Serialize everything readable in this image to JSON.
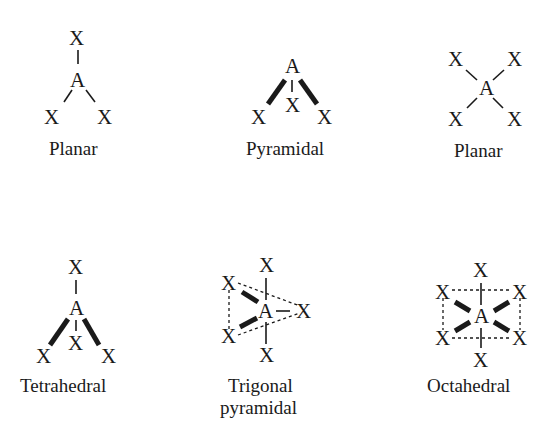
{
  "diagram": {
    "geometries": [
      {
        "id": "planar-trigonal",
        "label": "Planar",
        "central_atom": "A",
        "ligand": "X",
        "ligand_count": 3
      },
      {
        "id": "pyramidal",
        "label": "Pyramidal",
        "central_atom": "A",
        "ligand": "X",
        "ligand_count": 3
      },
      {
        "id": "planar-square",
        "label": "Planar",
        "central_atom": "A",
        "ligand": "X",
        "ligand_count": 4
      },
      {
        "id": "tetrahedral",
        "label": "Tetrahedral",
        "central_atom": "A",
        "ligand": "X",
        "ligand_count": 4
      },
      {
        "id": "trigonal-bipyramidal",
        "label_line1": "Trigonal",
        "label_line2": "pyramidal",
        "central_atom": "A",
        "ligand": "X",
        "ligand_count": 5
      },
      {
        "id": "octahedral",
        "label": "Octahedral",
        "central_atom": "A",
        "ligand": "X",
        "ligand_count": 6
      }
    ],
    "symbols": {
      "center": "A",
      "ligand": "X"
    }
  }
}
